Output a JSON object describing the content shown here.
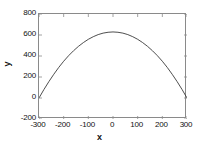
{
  "chart_data": {
    "type": "line",
    "title": "",
    "subtitle": "",
    "xlabel": "x",
    "ylabel": "y",
    "xlim": [
      -300,
      300
    ],
    "ylim": [
      -200,
      800
    ],
    "xticks": [
      -300,
      -200,
      -100,
      0,
      100,
      200,
      300
    ],
    "yticks": [
      -200,
      0,
      200,
      400,
      600,
      800
    ],
    "xtick_labels": [
      "-300",
      "-200",
      "-100",
      "0",
      "100",
      "200",
      "300"
    ],
    "ytick_labels": [
      "800",
      "600",
      "400",
      "200",
      "0",
      "-200"
    ],
    "grid": false,
    "legend": null,
    "legend_position": "none",
    "line_color": "#3a3a3a",
    "line_width": 1,
    "frame_color": "#8a8a8a",
    "background_color": "#ffffff",
    "series": [
      {
        "name": "curve",
        "description": "downward-opening parabola peaking near 629 at x=0 and reaching 0 at x=-300 and x=300",
        "x": [
          -300,
          -280,
          -260,
          -240,
          -220,
          -200,
          -180,
          -160,
          -140,
          -120,
          -100,
          -80,
          -60,
          -40,
          -20,
          0,
          20,
          40,
          60,
          80,
          100,
          120,
          140,
          160,
          180,
          200,
          220,
          240,
          260,
          280,
          300
        ],
        "y": [
          0,
          81,
          156,
          226,
          291,
          350,
          403,
          450,
          492,
          528,
          559,
          584,
          604,
          618,
          626,
          629,
          626,
          618,
          604,
          584,
          559,
          528,
          492,
          450,
          403,
          350,
          291,
          226,
          156,
          81,
          0
        ]
      }
    ]
  },
  "axes": {
    "x_tick_values": [
      "-300",
      "-200",
      "-100",
      "0",
      "100",
      "200",
      "300"
    ],
    "y_tick_values": [
      "800",
      "600",
      "400",
      "200",
      "0",
      "-200"
    ],
    "x_axis_label": "x",
    "y_axis_label": "y"
  }
}
